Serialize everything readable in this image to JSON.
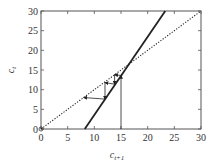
{
  "chart_data": {
    "type": "line",
    "title": "",
    "xlabel": "c_{t+1}",
    "ylabel": "c_t",
    "xlabel_main": "c",
    "xlabel_sub": "t+1",
    "ylabel_main": "c",
    "ylabel_sub": "t",
    "xlim": [
      0,
      30
    ],
    "ylim": [
      0,
      30
    ],
    "xticks": [
      0,
      5,
      10,
      15,
      20,
      25,
      30
    ],
    "yticks": [
      0,
      5,
      10,
      15,
      20,
      25,
      30
    ],
    "grid": false,
    "legend": null,
    "series": [
      {
        "name": "45-degree line",
        "style": "dotted",
        "x": [
          0,
          30
        ],
        "y": [
          0,
          30
        ]
      },
      {
        "name": "phase line",
        "style": "solid",
        "x": [
          8.2,
          23.3
        ],
        "y": [
          0,
          30
        ]
      }
    ],
    "cobweb_path": {
      "style": "thin solid with arrowheads",
      "points": [
        [
          15,
          0
        ],
        [
          15,
          13.6
        ],
        [
          13.8,
          13.8
        ],
        [
          13.8,
          11.4
        ],
        [
          12,
          11.8
        ],
        [
          12,
          7.6
        ],
        [
          8,
          8
        ]
      ]
    },
    "intersection": [
      16.4,
      16.4
    ],
    "origin_marker": [
      0,
      0
    ]
  }
}
